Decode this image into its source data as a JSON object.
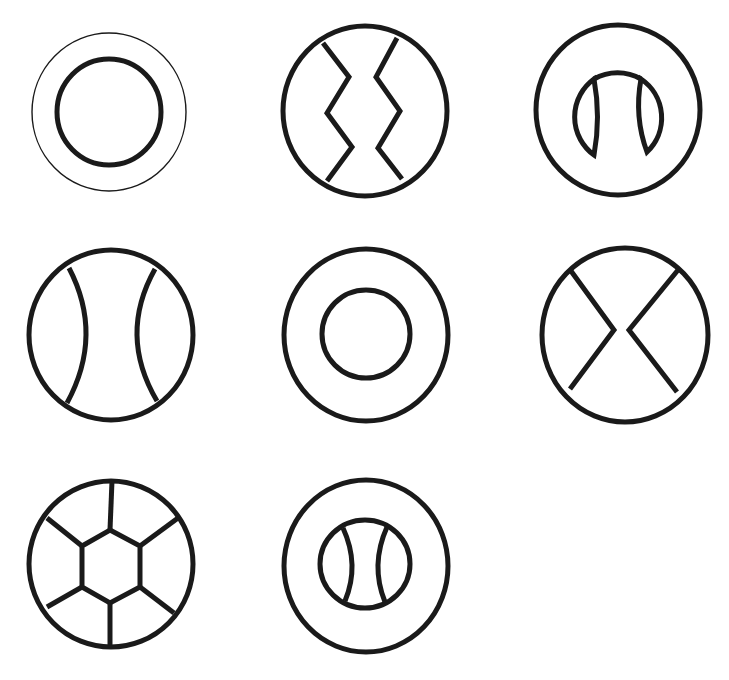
{
  "diagram": {
    "title": "Circle pattern figures",
    "stroke_color": "#1a1a1a",
    "background": "#ffffff",
    "layout": {
      "rows": 3,
      "columns": 3,
      "figure_count": 8
    },
    "figures": [
      {
        "id": 1,
        "row": 1,
        "col": 1,
        "label": "Thin outer circle with thick inner concentric circle",
        "description": "double-ring-thin-outer"
      },
      {
        "id": 2,
        "row": 1,
        "col": 2,
        "label": "Circle with two vertical zigzag lines",
        "description": "zigzag-split-circle"
      },
      {
        "id": 3,
        "row": 1,
        "col": 3,
        "label": "Circle containing arch with two lens-shaped cutouts",
        "description": "arch-with-lenses"
      },
      {
        "id": 4,
        "row": 2,
        "col": 1,
        "label": "Circle with two inward-curving arcs",
        "description": "seam-ball"
      },
      {
        "id": 5,
        "row": 2,
        "col": 2,
        "label": "Two concentric thick circles",
        "description": "concentric-rings"
      },
      {
        "id": 6,
        "row": 2,
        "col": 3,
        "label": "Circle with two facing chevron lines",
        "description": "bowtie-circle"
      },
      {
        "id": 7,
        "row": 3,
        "col": 1,
        "label": "Circle with central hexagon and six spokes",
        "description": "hexagon-wheel"
      },
      {
        "id": 8,
        "row": 3,
        "col": 2,
        "label": "Circle with inner seam-ball circle",
        "description": "nested-seam-ball"
      }
    ]
  }
}
